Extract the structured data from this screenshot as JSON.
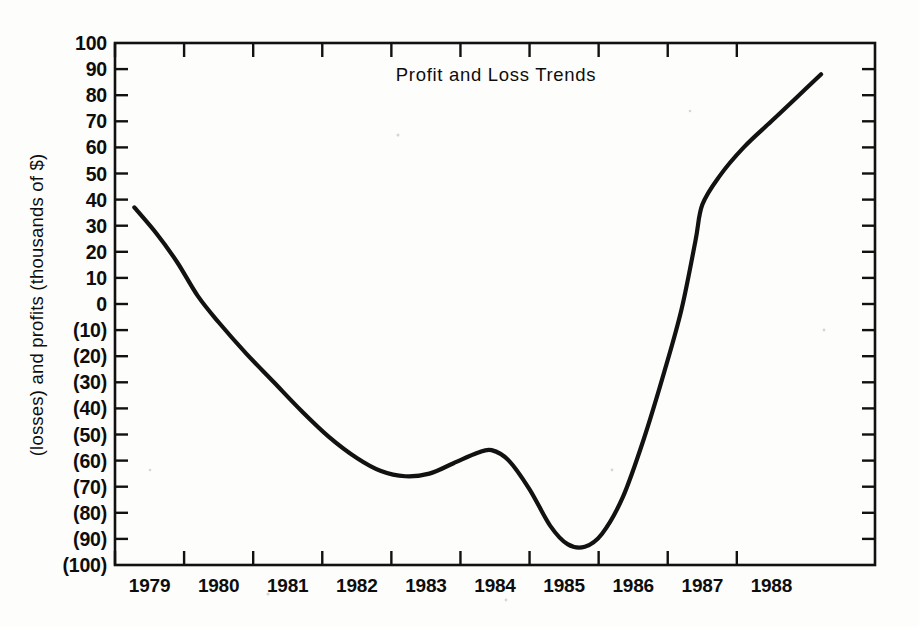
{
  "chart_data": {
    "type": "line",
    "title": "Profit and Loss Trends",
    "xlabel": "",
    "ylabel": "(losses) and profits (thousands of $)",
    "grid": false,
    "legend": "none",
    "xlim": [
      1978.5,
      1989.5
    ],
    "ylim": [
      -100,
      100
    ],
    "y_tick_labels": [
      "100",
      "90",
      "80",
      "70",
      "60",
      "50",
      "40",
      "30",
      "20",
      "10",
      "0",
      "(10)",
      "(20)",
      "(30)",
      "(40)",
      "(50)",
      "(60)",
      "(70)",
      "(80)",
      "(90)",
      "(100)"
    ],
    "y_tick_values": [
      100,
      90,
      80,
      70,
      60,
      50,
      40,
      30,
      20,
      10,
      0,
      -10,
      -20,
      -30,
      -40,
      -50,
      -60,
      -70,
      -80,
      -90,
      -100
    ],
    "x_tick_labels": [
      "1979",
      "1980",
      "1981",
      "1982",
      "1983",
      "1984",
      "1985",
      "1986",
      "1987",
      "1988"
    ],
    "x_tick_values": [
      1979,
      1980,
      1981,
      1982,
      1983,
      1984,
      1985,
      1986,
      1987,
      1988
    ],
    "series": [
      {
        "name": "Profit and Loss",
        "points": [
          {
            "x": 1978.78,
            "y": 37
          },
          {
            "x": 1979.1,
            "y": 27
          },
          {
            "x": 1979.4,
            "y": 16
          },
          {
            "x": 1979.7,
            "y": 3
          },
          {
            "x": 1980.0,
            "y": -7
          },
          {
            "x": 1980.4,
            "y": -19
          },
          {
            "x": 1980.8,
            "y": -30
          },
          {
            "x": 1981.2,
            "y": -41
          },
          {
            "x": 1981.6,
            "y": -51
          },
          {
            "x": 1982.0,
            "y": -59
          },
          {
            "x": 1982.35,
            "y": -64
          },
          {
            "x": 1982.7,
            "y": -66
          },
          {
            "x": 1983.05,
            "y": -65
          },
          {
            "x": 1983.4,
            "y": -61
          },
          {
            "x": 1983.75,
            "y": -57
          },
          {
            "x": 1983.95,
            "y": -56
          },
          {
            "x": 1984.2,
            "y": -60
          },
          {
            "x": 1984.5,
            "y": -71
          },
          {
            "x": 1984.8,
            "y": -85
          },
          {
            "x": 1985.05,
            "y": -92
          },
          {
            "x": 1985.3,
            "y": -93
          },
          {
            "x": 1985.55,
            "y": -88
          },
          {
            "x": 1985.85,
            "y": -74
          },
          {
            "x": 1986.15,
            "y": -52
          },
          {
            "x": 1986.45,
            "y": -26
          },
          {
            "x": 1986.7,
            "y": -2
          },
          {
            "x": 1986.9,
            "y": 24
          },
          {
            "x": 1987.0,
            "y": 38
          },
          {
            "x": 1987.25,
            "y": 49
          },
          {
            "x": 1987.6,
            "y": 60
          },
          {
            "x": 1988.0,
            "y": 70
          },
          {
            "x": 1988.4,
            "y": 80
          },
          {
            "x": 1988.72,
            "y": 88
          }
        ]
      }
    ]
  }
}
